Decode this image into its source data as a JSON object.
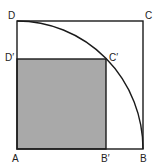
{
  "diagram": {
    "type": "geometry",
    "colors": {
      "stroke": "#1a1a1a",
      "shaded_fill": "#a9a9a9",
      "background": "#ffffff"
    },
    "points": {
      "A": {
        "label": "A"
      },
      "B": {
        "label": "B"
      },
      "C": {
        "label": "C"
      },
      "D": {
        "label": "D"
      },
      "B_prime": {
        "label": "B′"
      },
      "C_prime": {
        "label": "C′"
      },
      "D_prime": {
        "label": "D′"
      }
    }
  }
}
